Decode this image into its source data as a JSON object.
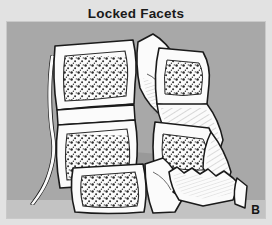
{
  "figure": {
    "title": "Locked Facets",
    "panel_label": "B",
    "colors": {
      "page_background": "#e2e2e2",
      "panel_background": "#a8a8a8",
      "bone_fill": "#fbfbfb",
      "bone_outline": "#1a1a1a",
      "cancellous_stipple": "#2b2b2b",
      "shadow_tone": "#8f8f8f",
      "ground_band": "#c3c3c3",
      "title_color": "#1a1a1a",
      "label_color": "#141414"
    },
    "structures": [
      {
        "name": "upper-vertebral-body-1",
        "description": "Upper intact vertebral body with cancellous bone stippling"
      },
      {
        "name": "upper-vertebral-body-2",
        "description": "Second intact vertebral body with cancellous bone stippling"
      },
      {
        "name": "anterior-longitudinal-ligament",
        "description": "Thin curved ligament strand descending along anterior margin"
      },
      {
        "name": "dislocated-vertebral-body-upper",
        "description": "Anteriorly displaced vertebral body with stippled interior"
      },
      {
        "name": "dislocated-vertebral-body-lower",
        "description": "Second displaced vertebral body with stippled interior"
      },
      {
        "name": "locked-facet-joint",
        "description": "Perched and locked articular facets at the dislocation level"
      },
      {
        "name": "posterior-element-fragment",
        "description": "Shaded posterior elements with hatched shading"
      },
      {
        "name": "lower-vertebral-body",
        "description": "Lower intact vertebral body with cancellous bone stippling"
      },
      {
        "name": "inferior-articular-process",
        "description": "Inferior articular process projecting from lower segment"
      },
      {
        "name": "fractured-lamina-fragment",
        "description": "Irregular fractured bone fragment with serrated edge"
      },
      {
        "name": "spinous-process-fragment",
        "description": "Displaced spinous process fragment"
      }
    ]
  }
}
